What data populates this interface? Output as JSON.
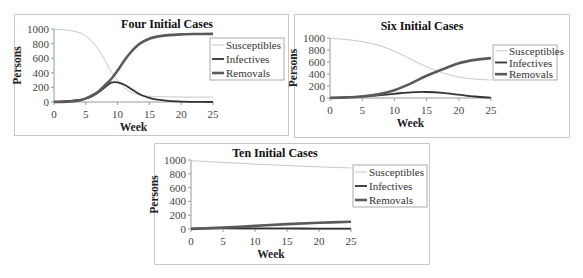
{
  "chart_data": [
    {
      "type": "line",
      "title": "Four Initial Cases",
      "xlabel": "Week",
      "ylabel": "Persons",
      "xlim": [
        0,
        25
      ],
      "ylim": [
        0,
        1000
      ],
      "xticks": [
        0,
        5,
        10,
        15,
        20,
        25
      ],
      "yticks": [
        0,
        200,
        400,
        600,
        800,
        1000
      ],
      "grid": false,
      "legend_position": "right",
      "x": [
        0,
        2,
        4,
        5,
        6,
        7,
        8,
        9,
        10,
        11,
        12,
        13,
        14,
        15,
        16,
        18,
        20,
        22,
        25
      ],
      "series": [
        {
          "name": "Susceptibles",
          "color": "#c8c8c8",
          "width": 1,
          "values": [
            996,
            985,
            950,
            905,
            830,
            720,
            570,
            420,
            300,
            200,
            140,
            105,
            88,
            78,
            73,
            70,
            68,
            67,
            67
          ]
        },
        {
          "name": "Infectives",
          "color": "#333333",
          "width": 1.8,
          "values": [
            4,
            10,
            28,
            45,
            80,
            135,
            200,
            265,
            270,
            240,
            185,
            130,
            85,
            55,
            35,
            14,
            5,
            2,
            0
          ]
        },
        {
          "name": "Removals",
          "color": "#5a5a5a",
          "width": 2.6,
          "values": [
            0,
            5,
            22,
            50,
            90,
            145,
            230,
            315,
            430,
            560,
            675,
            765,
            827,
            867,
            892,
            916,
            927,
            931,
            933
          ]
        }
      ]
    },
    {
      "type": "line",
      "title": "Six Initial Cases",
      "xlabel": "Week",
      "ylabel": "Persons",
      "xlim": [
        0,
        25
      ],
      "ylim": [
        0,
        1000
      ],
      "xticks": [
        0,
        5,
        10,
        15,
        20,
        25
      ],
      "yticks": [
        0,
        200,
        400,
        600,
        800,
        1000
      ],
      "grid": false,
      "legend_position": "right",
      "x": [
        0,
        2.5,
        5,
        7.5,
        10,
        12.5,
        15,
        17.5,
        20,
        22.5,
        25
      ],
      "series": [
        {
          "name": "Susceptibles",
          "color": "#c8c8c8",
          "width": 1,
          "values": [
            994,
            975,
            940,
            880,
            780,
            650,
            520,
            420,
            350,
            315,
            300
          ]
        },
        {
          "name": "Infectives",
          "color": "#333333",
          "width": 1.8,
          "values": [
            6,
            12,
            25,
            45,
            70,
            95,
            100,
            85,
            55,
            25,
            5
          ]
        },
        {
          "name": "Removals",
          "color": "#5a5a5a",
          "width": 2.6,
          "values": [
            0,
            10,
            25,
            60,
            130,
            240,
            370,
            480,
            580,
            635,
            665
          ]
        }
      ]
    },
    {
      "type": "line",
      "title": "Ten Initial Cases",
      "xlabel": "Week",
      "ylabel": "Persons",
      "xlim": [
        0,
        25
      ],
      "ylim": [
        0,
        1000
      ],
      "xticks": [
        0,
        5,
        10,
        15,
        20,
        25
      ],
      "yticks": [
        0,
        200,
        400,
        600,
        800,
        1000
      ],
      "grid": false,
      "legend_position": "right",
      "x": [
        0,
        5,
        10,
        15,
        20,
        25
      ],
      "series": [
        {
          "name": "Susceptibles",
          "color": "#c8c8c8",
          "width": 1,
          "values": [
            990,
            965,
            940,
            920,
            900,
            885
          ]
        },
        {
          "name": "Infectives",
          "color": "#333333",
          "width": 1.8,
          "values": [
            10,
            12,
            10,
            8,
            6,
            4
          ]
        },
        {
          "name": "Removals",
          "color": "#5a5a5a",
          "width": 2.6,
          "values": [
            0,
            20,
            45,
            70,
            90,
            105
          ]
        }
      ]
    }
  ],
  "layout": [
    {
      "frame": [
        14,
        14,
        275,
        122
      ],
      "plot": [
        54,
        29,
        213,
        102
      ],
      "legend": [
        210,
        38,
        74,
        42
      ],
      "title_x": 167,
      "title_y": 28
    },
    {
      "frame": [
        294,
        14,
        276,
        124
      ],
      "plot": [
        330,
        38,
        491,
        98
      ],
      "legend": [
        493,
        45,
        64,
        35
      ],
      "title_x": 422,
      "title_y": 30
    },
    {
      "frame": [
        154,
        143,
        276,
        122
      ],
      "plot": [
        191,
        160,
        351,
        229
      ],
      "legend": [
        353,
        165,
        74,
        42
      ],
      "title_x": 275,
      "title_y": 157
    }
  ]
}
